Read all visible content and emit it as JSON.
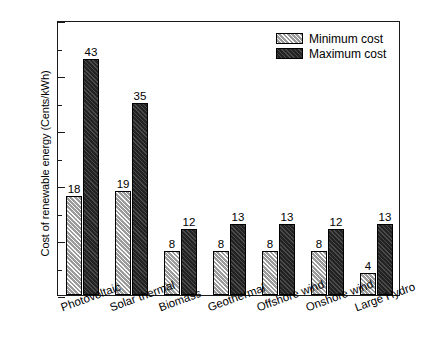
{
  "chart_data": {
    "type": "bar",
    "title": "",
    "xlabel": "",
    "ylabel": "Cost of renewable energy (Cents/kWh)",
    "categories": [
      "Photovoltaic",
      "Solar thermal",
      "Biomass",
      "Geothermal",
      "Offshore wind",
      "Onshore wind",
      "Large Hydro"
    ],
    "series": [
      {
        "name": "Minimum cost",
        "values": [
          18,
          19,
          8,
          8,
          8,
          8,
          4
        ],
        "color": "#9b9b9b",
        "pattern": "diagonal-hatch"
      },
      {
        "name": "Maximum cost",
        "values": [
          43,
          35,
          12,
          13,
          13,
          12,
          13
        ],
        "color": "#232323",
        "pattern": "solid-dark"
      }
    ],
    "ylim": [
      0,
      50
    ],
    "ytick_labels": [
      "0",
      "10",
      "20",
      "30",
      "40",
      "50"
    ],
    "ytick_values": [
      0,
      10,
      20,
      30,
      40,
      50
    ],
    "yminor_values": [
      5,
      15,
      25,
      35,
      45
    ],
    "grid": false,
    "legend_position": "top-right",
    "data_labels": true
  },
  "legend": {
    "entries": [
      {
        "label": "Minimum cost"
      },
      {
        "label": "Maximum cost"
      }
    ]
  }
}
